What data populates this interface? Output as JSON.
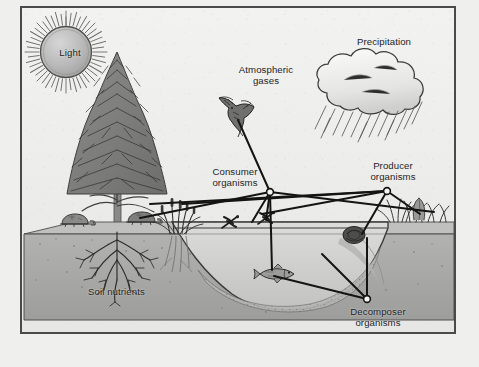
{
  "diagram": {
    "type": "ecosystem-cross-section",
    "frame": {
      "border_color": "#4a4a4c",
      "background": "#eeeeec"
    }
  },
  "labels": {
    "light": "Light",
    "atmospheric_gases": "Atmospheric\ngases",
    "precipitation": "Precipitation",
    "consumer_organisms": "Consumer\norganisms",
    "producer_organisms": "Producer\norganisms",
    "decomposer_organisms": "Decomposer\norganisms",
    "soil_nutrients": "Soil nutrients"
  },
  "features": {
    "sun": {
      "name": "sun",
      "label": "Light",
      "fill": "#b8b8b8",
      "rays": 48
    },
    "tree": {
      "name": "conifer-tree",
      "species": "conifer"
    },
    "cloud": {
      "name": "rain-cloud",
      "precipitation": true
    },
    "bird": {
      "name": "flying-bird",
      "role": "consumer"
    },
    "fish": {
      "name": "fish",
      "role": "consumer"
    },
    "dragonflies": {
      "name": "dragonfly",
      "count": 2,
      "role": "consumer"
    },
    "turtles": {
      "name": "turtle",
      "count": 2,
      "role": "consumer"
    },
    "mollusk": {
      "name": "mollusk",
      "role": "decomposer"
    },
    "cattails": {
      "name": "cattail-reeds",
      "role": "producer"
    },
    "grass": {
      "name": "bank-grass",
      "role": "producer"
    },
    "pond": {
      "name": "pond-water",
      "fill": "#cfcfcd"
    },
    "soil": {
      "name": "soil-block",
      "fill": "#a9a9a7"
    },
    "roots": {
      "name": "tree-roots"
    }
  },
  "nodes": [
    {
      "id": "consumer-node",
      "label": "Consumer organisms",
      "x": 268,
      "y": 190
    },
    {
      "id": "producer-node",
      "label": "Producer organisms",
      "x": 385,
      "y": 189
    },
    {
      "id": "decomposer-node",
      "label": "Decomposer organisms",
      "x": 365,
      "y": 297
    }
  ],
  "colors": {
    "ink": "#1d1d1f",
    "paper": "#efefee",
    "soil": "#a9a9a7",
    "water": "#cfcfcd",
    "sun": "#b8b8b8"
  }
}
